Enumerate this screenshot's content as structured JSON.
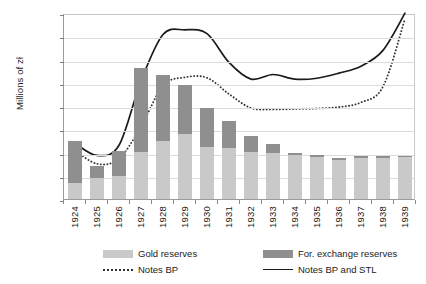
{
  "chart_data": {
    "type": "bar",
    "title": "",
    "xlabel": "",
    "ylabel": "Millions of zł",
    "ylim": [
      0,
      2000
    ],
    "ytick_values": [
      0,
      250,
      500,
      750,
      1000,
      1250,
      1500,
      1750,
      2000
    ],
    "ytick_labels": [
      "0",
      "250",
      "500",
      "750",
      "1,000",
      "1,250",
      "1,500",
      "1,750",
      "2,000"
    ],
    "grid": true,
    "legend_position": "bottom",
    "categories": [
      "1924",
      "1925",
      "1926",
      "1927",
      "1928",
      "1929",
      "1930",
      "1931",
      "1932",
      "1933",
      "1934",
      "1935",
      "1936",
      "1937",
      "1938",
      "1939"
    ],
    "stacked_series": [
      {
        "name": "Gold reserves",
        "color": "#c9c9c9",
        "values": [
          170,
          225,
          245,
          510,
          620,
          700,
          560,
          545,
          505,
          495,
          470,
          455,
          420,
          440,
          440,
          455
        ]
      },
      {
        "name": "For. exchange reserves",
        "color": "#8f8f8f",
        "values": [
          455,
          125,
          275,
          900,
          715,
          525,
          415,
          295,
          175,
          95,
          30,
          20,
          20,
          25,
          20,
          10
        ]
      }
    ],
    "stack_totals": [
      625,
      350,
      520,
      1410,
      1335,
      1225,
      975,
      840,
      680,
      590,
      500,
      475,
      440,
      465,
      460,
      465
    ],
    "line_series": [
      {
        "name": "Notes BP",
        "style": "dotted",
        "color": "#333333",
        "values": [
          545,
          400,
          455,
          800,
          1240,
          1330,
          1325,
          1150,
          1000,
          985,
          990,
          995,
          1010,
          1060,
          1230,
          1960
        ]
      },
      {
        "name": "Notes BP and STL",
        "style": "solid",
        "color": "#1a1a1a",
        "values": [
          620,
          490,
          600,
          1290,
          1790,
          1840,
          1800,
          1490,
          1310,
          1360,
          1310,
          1320,
          1375,
          1450,
          1620,
          2020
        ]
      }
    ]
  },
  "legend": {
    "items": [
      {
        "label": "Gold reserves",
        "swatch": "gold-swatch"
      },
      {
        "label": "For. exchange reserves",
        "swatch": "fx-swatch"
      },
      {
        "label": "Notes BP",
        "swatch": "dotted-line-swatch"
      },
      {
        "label": "Notes BP and STL",
        "swatch": "solid-line-swatch"
      }
    ]
  }
}
